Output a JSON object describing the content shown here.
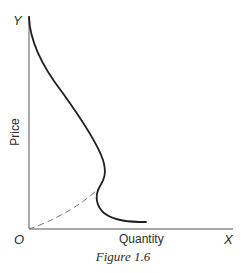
{
  "figure": {
    "caption": "Figure 1.6",
    "axes": {
      "y_letter": "Y",
      "x_letter": "X",
      "origin_letter": "O",
      "y_label": "Price",
      "x_label": "Quantity"
    },
    "curves": [
      {
        "name": "backward-bending-curve",
        "style": "solid",
        "description": "Curve descending from top of price axis, bulging right, bending back inward, then flattening out to the right near the quantity axis"
      },
      {
        "name": "dashed-extension",
        "style": "dashed",
        "description": "Dashed line rising from origin to the inward bend of the curve"
      }
    ],
    "colors": {
      "ink": "#2a2a2a",
      "axis": "#555555",
      "dashed": "#777777",
      "background": "#ffffff"
    }
  }
}
